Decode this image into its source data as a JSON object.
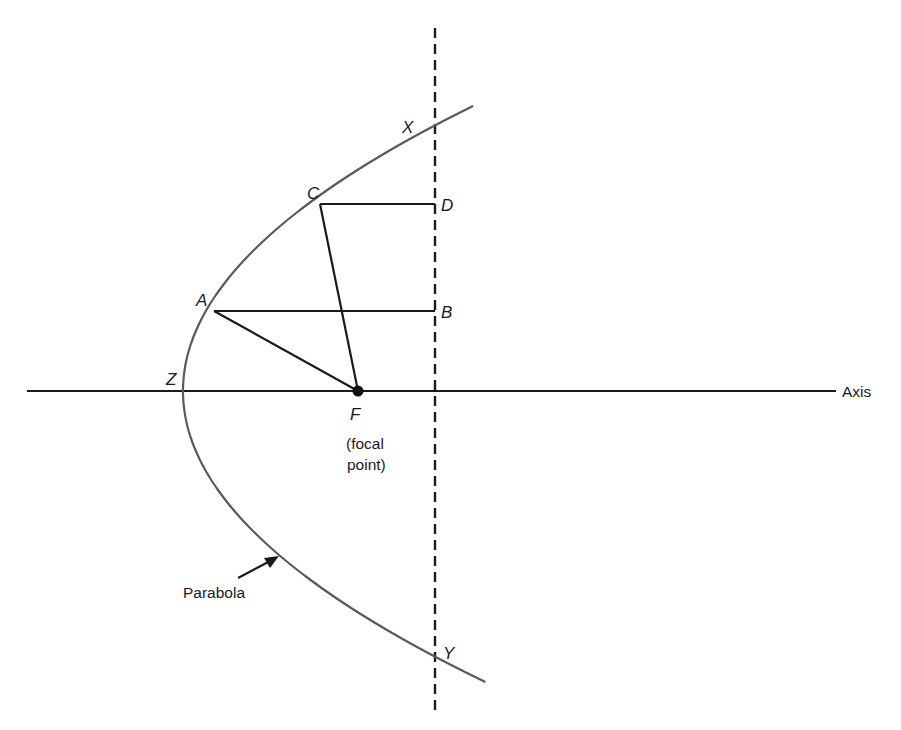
{
  "diagram": {
    "type": "parabolic-reflector-geometry",
    "colors": {
      "background": "#ffffff",
      "lines": "#1a1a1a",
      "parabola": "#5a5a5a",
      "text": "#1a1a1a"
    },
    "axis": {
      "label": "Axis",
      "y": 391,
      "x_start": 27,
      "x_end": 836
    },
    "directrix_like_line": {
      "style": "dashed",
      "x": 435,
      "y_start": 28,
      "y_end": 712
    },
    "parabola": {
      "label": "Parabola",
      "vertex": {
        "name": "Z",
        "x": 183,
        "y": 391
      },
      "top_end": {
        "x": 474,
        "y": 106
      },
      "bottom_end": {
        "x": 474,
        "y": 683
      }
    },
    "focus": {
      "name": "F",
      "caption_line1": "(focal",
      "caption_line2": "point)",
      "x": 358,
      "y": 391
    },
    "points": {
      "A": {
        "label": "A",
        "x": 214,
        "y": 311
      },
      "B": {
        "label": "B",
        "x": 435,
        "y": 311
      },
      "C": {
        "label": "C",
        "x": 320,
        "y": 204
      },
      "D": {
        "label": "D",
        "x": 435,
        "y": 204
      },
      "X": {
        "label": "X",
        "x": 435,
        "y": 125
      },
      "Y": {
        "label": "Y",
        "x": 435,
        "y": 657
      },
      "Z": {
        "label": "Z"
      }
    },
    "segments": [
      "A-B",
      "A-F",
      "C-D",
      "C-F"
    ]
  }
}
